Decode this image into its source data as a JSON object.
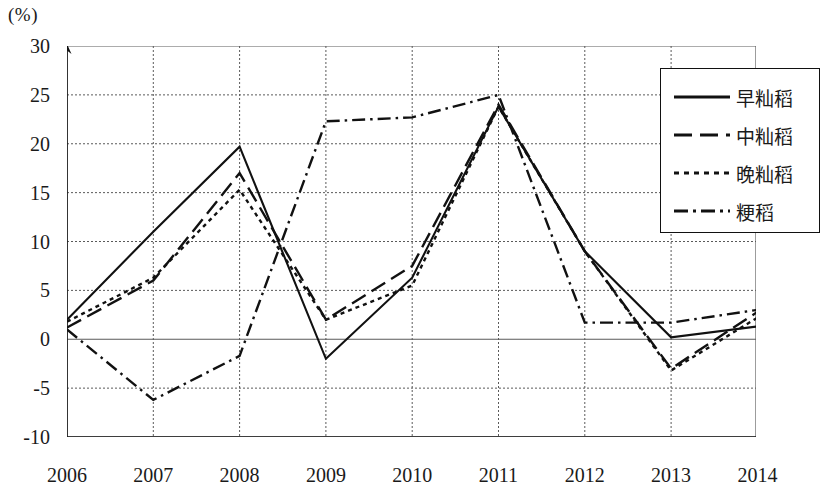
{
  "chart_data": {
    "type": "line",
    "title": "",
    "xlabel": "",
    "ylabel": "(%)",
    "unit_label": "(%)",
    "categories": [
      "2006",
      "2007",
      "2008",
      "2009",
      "2010",
      "2011",
      "2012",
      "2013",
      "2014"
    ],
    "x": [
      2006,
      2007,
      2008,
      2009,
      2010,
      2011,
      2012,
      2013,
      2014
    ],
    "ylim": [
      -10,
      30
    ],
    "yticks": [
      30,
      25,
      20,
      15,
      10,
      5,
      0,
      "-5",
      "-10"
    ],
    "ytick_values": [
      30,
      25,
      20,
      15,
      10,
      5,
      0,
      -5,
      -10
    ],
    "grid": true,
    "legend_position": "top-right",
    "series": [
      {
        "name": "早籼稻",
        "style": "solid",
        "color": "#111111",
        "values": [
          2.0,
          11.0,
          19.7,
          -2.0,
          6.3,
          23.8,
          9.0,
          0.2,
          1.3
        ]
      },
      {
        "name": "中籼稻",
        "style": "dashed",
        "color": "#111111",
        "values": [
          1.2,
          6.0,
          17.0,
          2.0,
          7.5,
          24.0,
          9.0,
          -3.0,
          2.8
        ]
      },
      {
        "name": "晚籼稻",
        "style": "dotted",
        "color": "#111111",
        "values": [
          1.8,
          6.3,
          15.3,
          2.0,
          5.5,
          23.8,
          9.0,
          -3.2,
          2.2
        ]
      },
      {
        "name": "粳稻",
        "style": "dashdot",
        "color": "#111111",
        "values": [
          1.0,
          -6.2,
          -1.7,
          22.3,
          22.7,
          25.0,
          1.7,
          1.7,
          3.0
        ]
      }
    ]
  },
  "legend": {
    "items": [
      {
        "label": "早籼稻",
        "style": "solid"
      },
      {
        "label": "中籼稻",
        "style": "dashed"
      },
      {
        "label": "晚籼稻",
        "style": "dotted"
      },
      {
        "label": "粳稻",
        "style": "dashdot"
      }
    ]
  }
}
